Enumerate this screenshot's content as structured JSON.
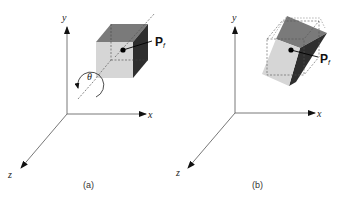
{
  "figure": {
    "panels": [
      {
        "id": "a",
        "caption": "(a)",
        "axes": {
          "x": "x",
          "y": "y",
          "z": "z"
        },
        "point_label": "P",
        "point_subscript": "f",
        "rotation_label": "θ"
      },
      {
        "id": "b",
        "caption": "(b)",
        "axes": {
          "x": "x",
          "y": "y",
          "z": "z"
        },
        "point_label": "P",
        "point_subscript": "f"
      }
    ],
    "colors": {
      "cube_front": "#d6d6d6",
      "cube_top": "#7a7a7a",
      "cube_side": "#2e2e2e",
      "axis": "#444444"
    }
  }
}
